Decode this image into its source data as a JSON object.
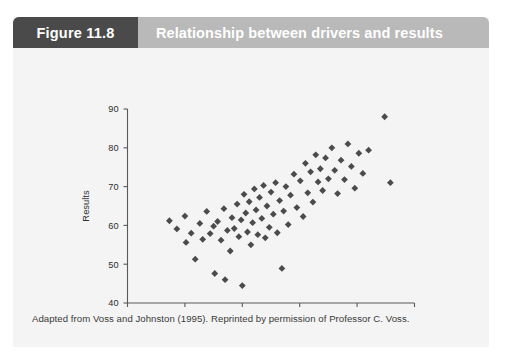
{
  "figure": {
    "number_label": "Figure 11.8",
    "title": "Relationship between drivers and results",
    "caption": "Adapted from Voss and Johnston (1995). Reprinted by permission of Professor C. Voss.",
    "header_bg": "#b9b9b9",
    "tag_bg": "#4a4a4a",
    "panel_bg": "#f4f4f4",
    "marker_color": "#4b4b4b"
  },
  "chart_data": {
    "type": "scatter",
    "title": "Relationship between drivers and results",
    "xlabel": "Drivers",
    "ylabel": "Results",
    "xlim": [
      40,
      90
    ],
    "ylim": [
      40,
      90
    ],
    "xticks": [
      40,
      50,
      60,
      70,
      80,
      90
    ],
    "yticks": [
      40,
      50,
      60,
      70,
      80,
      90
    ],
    "grid": false,
    "legend": null,
    "marker": "diamond",
    "point_count": 76,
    "points": [
      [
        47.3,
        61.2
      ],
      [
        48.6,
        59.1
      ],
      [
        50.0,
        62.4
      ],
      [
        50.2,
        55.6
      ],
      [
        51.1,
        58.0
      ],
      [
        51.8,
        51.3
      ],
      [
        52.6,
        60.5
      ],
      [
        53.1,
        56.4
      ],
      [
        53.8,
        63.6
      ],
      [
        54.4,
        57.9
      ],
      [
        55.0,
        59.8
      ],
      [
        55.2,
        47.6
      ],
      [
        55.7,
        61.0
      ],
      [
        56.3,
        56.2
      ],
      [
        56.8,
        64.3
      ],
      [
        57.0,
        46.0
      ],
      [
        57.4,
        58.7
      ],
      [
        57.9,
        53.4
      ],
      [
        58.2,
        62.0
      ],
      [
        58.6,
        59.2
      ],
      [
        59.1,
        65.5
      ],
      [
        59.4,
        57.1
      ],
      [
        59.8,
        61.4
      ],
      [
        60.0,
        44.5
      ],
      [
        60.3,
        68.0
      ],
      [
        60.6,
        63.2
      ],
      [
        60.9,
        58.3
      ],
      [
        61.2,
        66.1
      ],
      [
        61.5,
        55.0
      ],
      [
        61.8,
        60.7
      ],
      [
        62.1,
        69.4
      ],
      [
        62.4,
        64.0
      ],
      [
        62.7,
        57.6
      ],
      [
        63.0,
        67.2
      ],
      [
        63.4,
        61.8
      ],
      [
        63.7,
        70.3
      ],
      [
        64.0,
        56.8
      ],
      [
        64.3,
        65.0
      ],
      [
        64.7,
        59.5
      ],
      [
        65.0,
        68.6
      ],
      [
        65.4,
        62.9
      ],
      [
        65.8,
        71.0
      ],
      [
        66.1,
        58.1
      ],
      [
        66.5,
        66.4
      ],
      [
        66.9,
        48.9
      ],
      [
        67.2,
        63.7
      ],
      [
        67.6,
        70.0
      ],
      [
        68.0,
        60.2
      ],
      [
        68.4,
        67.8
      ],
      [
        69.0,
        73.2
      ],
      [
        69.5,
        64.6
      ],
      [
        70.1,
        71.5
      ],
      [
        70.6,
        62.3
      ],
      [
        71.0,
        76.0
      ],
      [
        71.4,
        68.4
      ],
      [
        71.9,
        73.8
      ],
      [
        72.3,
        66.0
      ],
      [
        72.8,
        78.2
      ],
      [
        73.2,
        71.2
      ],
      [
        73.6,
        74.6
      ],
      [
        74.0,
        69.0
      ],
      [
        74.5,
        77.4
      ],
      [
        75.0,
        72.0
      ],
      [
        75.6,
        80.0
      ],
      [
        76.1,
        74.2
      ],
      [
        76.6,
        68.2
      ],
      [
        77.2,
        76.8
      ],
      [
        77.8,
        71.8
      ],
      [
        78.4,
        81.0
      ],
      [
        79.0,
        75.2
      ],
      [
        79.6,
        69.6
      ],
      [
        80.3,
        78.6
      ],
      [
        81.0,
        73.4
      ],
      [
        82.0,
        79.4
      ],
      [
        84.8,
        88.0
      ],
      [
        85.8,
        71.0
      ]
    ]
  }
}
